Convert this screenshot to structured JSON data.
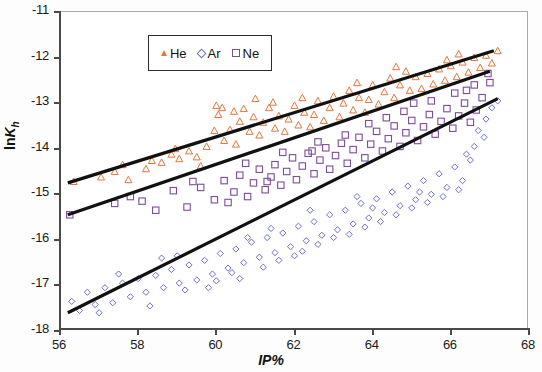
{
  "chart_data": {
    "type": "scatter",
    "title": "",
    "xlabel": "IP%",
    "ylabel": "lnKh",
    "xlim": [
      56,
      68
    ],
    "ylim": [
      -18,
      -11
    ],
    "xticks": [
      56,
      58,
      60,
      62,
      64,
      66,
      68
    ],
    "yticks": [
      -11,
      -12,
      -13,
      -14,
      -15,
      -16,
      -17,
      -18
    ],
    "grid": false,
    "legend_position": "top-left-inside",
    "series": [
      {
        "name": "He",
        "marker": "triangle",
        "color": "#E8743B",
        "trendline": {
          "x": [
            56.2,
            67.1
          ],
          "y": [
            -14.75,
            -11.85
          ]
        },
        "points": [
          [
            56.35,
            -14.72
          ],
          [
            57.05,
            -14.62
          ],
          [
            57.4,
            -14.5
          ],
          [
            57.75,
            -14.68
          ],
          [
            58.2,
            -14.44
          ],
          [
            58.35,
            -14.26
          ],
          [
            58.6,
            -14.3
          ],
          [
            58.85,
            -14.12
          ],
          [
            59.05,
            -14.22
          ],
          [
            59.3,
            -14.05
          ],
          [
            59.5,
            -14.18
          ],
          [
            59.75,
            -13.95
          ],
          [
            59.95,
            -13.6
          ],
          [
            60.0,
            -13.05
          ],
          [
            60.05,
            -13.25
          ],
          [
            60.2,
            -13.82
          ],
          [
            60.35,
            -13.58
          ],
          [
            60.5,
            -13.9
          ],
          [
            60.6,
            -13.4
          ],
          [
            60.7,
            -13.12
          ],
          [
            60.85,
            -13.62
          ],
          [
            60.95,
            -13.3
          ],
          [
            61.1,
            -13.7
          ],
          [
            61.2,
            -13.42
          ],
          [
            61.35,
            -13.1
          ],
          [
            61.5,
            -13.55
          ],
          [
            61.6,
            -13.28
          ],
          [
            61.75,
            -13.62
          ],
          [
            61.85,
            -13.35
          ],
          [
            62.0,
            -13.05
          ],
          [
            62.1,
            -13.48
          ],
          [
            62.25,
            -13.2
          ],
          [
            62.4,
            -13.52
          ],
          [
            62.5,
            -13.25
          ],
          [
            62.6,
            -12.95
          ],
          [
            62.75,
            -13.38
          ],
          [
            62.9,
            -13.1
          ],
          [
            63.0,
            -12.85
          ],
          [
            63.15,
            -13.3
          ],
          [
            63.25,
            -13.0
          ],
          [
            63.4,
            -12.72
          ],
          [
            63.5,
            -13.15
          ],
          [
            63.65,
            -12.88
          ],
          [
            63.8,
            -13.2
          ],
          [
            63.9,
            -12.92
          ],
          [
            64.0,
            -12.6
          ],
          [
            64.15,
            -13.02
          ],
          [
            64.3,
            -12.75
          ],
          [
            64.45,
            -12.45
          ],
          [
            64.55,
            -12.88
          ],
          [
            64.7,
            -12.6
          ],
          [
            64.85,
            -12.3
          ],
          [
            64.95,
            -12.72
          ],
          [
            65.1,
            -12.42
          ],
          [
            65.25,
            -12.68
          ],
          [
            65.4,
            -12.35
          ],
          [
            65.55,
            -12.58
          ],
          [
            65.7,
            -12.25
          ],
          [
            65.85,
            -12.5
          ],
          [
            66.0,
            -12.18
          ],
          [
            66.15,
            -12.42
          ],
          [
            66.3,
            -12.1
          ],
          [
            66.45,
            -12.32
          ],
          [
            66.6,
            -12.0
          ],
          [
            66.75,
            -12.22
          ],
          [
            66.9,
            -11.95
          ],
          [
            67.05,
            -12.12
          ],
          [
            67.2,
            -11.85
          ],
          [
            57.6,
            -14.35
          ],
          [
            58.95,
            -14.0
          ],
          [
            60.15,
            -13.1
          ],
          [
            61.45,
            -12.98
          ],
          [
            62.2,
            -12.88
          ],
          [
            63.6,
            -12.55
          ],
          [
            64.6,
            -12.2
          ],
          [
            65.9,
            -12.05
          ],
          [
            66.2,
            -11.92
          ],
          [
            59.6,
            -14.38
          ],
          [
            60.45,
            -13.18
          ],
          [
            61.0,
            -12.9
          ]
        ]
      },
      {
        "name": "Ne",
        "marker": "square",
        "color": "#7D4C9E",
        "trendline": {
          "x": [
            56.2,
            67.0
          ],
          "y": [
            -15.45,
            -12.3
          ]
        },
        "points": [
          [
            56.25,
            -15.45
          ],
          [
            57.4,
            -15.2
          ],
          [
            57.8,
            -15.05
          ],
          [
            58.45,
            -15.35
          ],
          [
            58.9,
            -14.92
          ],
          [
            59.25,
            -15.28
          ],
          [
            59.6,
            -14.85
          ],
          [
            59.95,
            -15.12
          ],
          [
            60.2,
            -14.7
          ],
          [
            60.45,
            -14.95
          ],
          [
            60.6,
            -14.58
          ],
          [
            60.8,
            -15.05
          ],
          [
            60.95,
            -14.75
          ],
          [
            61.1,
            -14.45
          ],
          [
            61.25,
            -14.9
          ],
          [
            61.4,
            -14.62
          ],
          [
            61.5,
            -14.35
          ],
          [
            61.65,
            -14.8
          ],
          [
            61.8,
            -14.5
          ],
          [
            61.95,
            -14.2
          ],
          [
            62.05,
            -14.68
          ],
          [
            62.2,
            -14.38
          ],
          [
            62.35,
            -14.1
          ],
          [
            62.5,
            -14.55
          ],
          [
            62.65,
            -14.25
          ],
          [
            62.8,
            -13.98
          ],
          [
            62.9,
            -14.45
          ],
          [
            63.05,
            -14.15
          ],
          [
            63.2,
            -13.88
          ],
          [
            63.35,
            -14.32
          ],
          [
            63.5,
            -14.02
          ],
          [
            63.65,
            -13.75
          ],
          [
            63.8,
            -14.2
          ],
          [
            63.95,
            -13.9
          ],
          [
            64.1,
            -13.62
          ],
          [
            64.25,
            -14.05
          ],
          [
            64.4,
            -13.78
          ],
          [
            64.55,
            -13.5
          ],
          [
            64.7,
            -13.95
          ],
          [
            64.85,
            -13.65
          ],
          [
            65.0,
            -13.38
          ],
          [
            65.15,
            -13.82
          ],
          [
            65.3,
            -13.52
          ],
          [
            65.45,
            -13.25
          ],
          [
            65.6,
            -13.68
          ],
          [
            65.75,
            -13.4
          ],
          [
            65.9,
            -13.12
          ],
          [
            66.05,
            -13.55
          ],
          [
            66.2,
            -13.28
          ],
          [
            66.35,
            -13.0
          ],
          [
            66.5,
            -13.42
          ],
          [
            66.65,
            -13.15
          ],
          [
            66.8,
            -12.88
          ],
          [
            66.95,
            -12.35
          ],
          [
            67.0,
            -12.55
          ],
          [
            60.3,
            -15.18
          ],
          [
            61.3,
            -14.72
          ],
          [
            62.45,
            -14.05
          ],
          [
            63.3,
            -13.7
          ],
          [
            64.35,
            -13.32
          ],
          [
            65.5,
            -12.95
          ],
          [
            66.1,
            -12.78
          ],
          [
            66.6,
            -12.6
          ],
          [
            59.4,
            -14.72
          ],
          [
            58.1,
            -15.15
          ],
          [
            60.75,
            -14.32
          ],
          [
            62.6,
            -13.85
          ],
          [
            63.9,
            -13.45
          ],
          [
            64.8,
            -13.18
          ],
          [
            65.05,
            -13.0
          ],
          [
            66.4,
            -12.72
          ],
          [
            61.7,
            -14.08
          ]
        ]
      },
      {
        "name": "Ar",
        "marker": "diamond",
        "color": "#6B6FD0",
        "trendline": {
          "x": [
            56.2,
            67.2
          ],
          "y": [
            -17.6,
            -12.9
          ]
        },
        "points": [
          [
            56.3,
            -17.35
          ],
          [
            56.5,
            -17.55
          ],
          [
            56.7,
            -17.15
          ],
          [
            56.9,
            -17.42
          ],
          [
            57.15,
            -17.05
          ],
          [
            57.35,
            -17.38
          ],
          [
            57.6,
            -16.95
          ],
          [
            57.8,
            -17.25
          ],
          [
            58.0,
            -16.85
          ],
          [
            58.2,
            -17.15
          ],
          [
            58.45,
            -16.78
          ],
          [
            58.65,
            -17.05
          ],
          [
            58.85,
            -16.65
          ],
          [
            59.05,
            -16.95
          ],
          [
            59.3,
            -16.55
          ],
          [
            59.5,
            -16.88
          ],
          [
            59.7,
            -16.45
          ],
          [
            59.9,
            -16.75
          ],
          [
            60.1,
            -16.3
          ],
          [
            60.3,
            -16.62
          ],
          [
            60.5,
            -16.2
          ],
          [
            60.7,
            -16.5
          ],
          [
            60.9,
            -16.05
          ],
          [
            61.1,
            -16.38
          ],
          [
            61.3,
            -15.95
          ],
          [
            61.5,
            -16.28
          ],
          [
            61.7,
            -15.85
          ],
          [
            61.9,
            -16.15
          ],
          [
            62.1,
            -15.7
          ],
          [
            62.3,
            -16.02
          ],
          [
            62.5,
            -15.6
          ],
          [
            62.7,
            -15.9
          ],
          [
            62.9,
            -15.45
          ],
          [
            63.1,
            -15.78
          ],
          [
            63.3,
            -15.35
          ],
          [
            63.5,
            -15.65
          ],
          [
            63.7,
            -15.2
          ],
          [
            63.9,
            -15.52
          ],
          [
            64.1,
            -15.1
          ],
          [
            64.3,
            -15.4
          ],
          [
            64.5,
            -14.95
          ],
          [
            64.7,
            -15.25
          ],
          [
            64.9,
            -14.82
          ],
          [
            65.1,
            -15.12
          ],
          [
            65.3,
            -14.7
          ],
          [
            65.5,
            -15.0
          ],
          [
            65.7,
            -14.55
          ],
          [
            65.9,
            -14.85
          ],
          [
            66.1,
            -14.4
          ],
          [
            66.3,
            -14.7
          ],
          [
            66.5,
            -14.25
          ],
          [
            66.7,
            -13.6
          ],
          [
            66.9,
            -13.35
          ],
          [
            67.05,
            -13.1
          ],
          [
            67.2,
            -12.95
          ],
          [
            66.85,
            -13.75
          ],
          [
            66.6,
            -13.95
          ],
          [
            66.4,
            -14.12
          ],
          [
            57.0,
            -17.6
          ],
          [
            58.3,
            -17.45
          ],
          [
            59.2,
            -17.1
          ],
          [
            60.0,
            -16.9
          ],
          [
            60.6,
            -16.85
          ],
          [
            61.2,
            -16.6
          ],
          [
            61.6,
            -16.45
          ],
          [
            62.0,
            -16.35
          ],
          [
            62.6,
            -16.1
          ],
          [
            63.0,
            -15.95
          ],
          [
            63.4,
            -15.88
          ],
          [
            63.8,
            -15.72
          ],
          [
            64.2,
            -15.6
          ],
          [
            64.6,
            -15.45
          ],
          [
            65.0,
            -15.3
          ],
          [
            65.4,
            -15.18
          ],
          [
            65.8,
            -15.05
          ],
          [
            66.2,
            -14.9
          ],
          [
            59.8,
            -17.05
          ],
          [
            60.4,
            -16.72
          ],
          [
            62.2,
            -16.25
          ],
          [
            64.0,
            -15.3
          ],
          [
            65.2,
            -14.95
          ],
          [
            62.4,
            -15.35
          ],
          [
            63.6,
            -15.05
          ],
          [
            60.8,
            -15.95
          ],
          [
            61.4,
            -15.75
          ],
          [
            58.6,
            -16.4
          ],
          [
            57.5,
            -16.75
          ],
          [
            59.0,
            -16.35
          ]
        ]
      }
    ]
  },
  "legend": {
    "entries": [
      {
        "label": "He",
        "marker": "triangle"
      },
      {
        "label": "Ar",
        "marker": "diamond"
      },
      {
        "label": "Ne",
        "marker": "square"
      }
    ]
  },
  "axes": {
    "y_tick_labels": [
      "-11",
      "-12",
      "-13",
      "-14",
      "-15",
      "-16",
      "-17",
      "-18"
    ],
    "x_tick_labels": [
      "56",
      "58",
      "60",
      "62",
      "64",
      "66",
      "68"
    ],
    "y_title_prefix": "ln",
    "y_title_symbol": "K",
    "y_title_sub": "h",
    "x_title": "IP%"
  },
  "colors": {
    "he": "#E8743B",
    "ne": "#7D4C9E",
    "ar": "#6B6FD0",
    "trendline": "#111111",
    "frame": "#a9a9a9"
  }
}
